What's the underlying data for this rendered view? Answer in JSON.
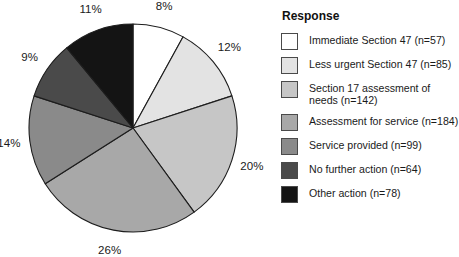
{
  "chart_data": {
    "type": "pie",
    "title": "",
    "legend_title": "Response",
    "legend_position": "right",
    "total_n": 709,
    "start_angle_deg": 0,
    "direction": "clockwise",
    "categories": [
      "Immediate Section 47 (n=57)",
      "Less urgent Section 47 (n=85)",
      "Section 17 assessment of needs (n=142)",
      "Assessment for service (n=184)",
      "Service provided (n=99)",
      "No further action (n=64)",
      "Other action (n=78)"
    ],
    "values": [
      8,
      12,
      20,
      26,
      14,
      9,
      11
    ],
    "counts": [
      57,
      85,
      142,
      184,
      99,
      64,
      78
    ],
    "value_labels": [
      "8%",
      "12%",
      "20%",
      "26%",
      "14%",
      "9%",
      "11%"
    ],
    "colors": [
      "#ffffff",
      "#e3e3e3",
      "#c6c6c6",
      "#a8a8a8",
      "#8a8a8a",
      "#4a4a4a",
      "#141414"
    ],
    "slices": [
      {
        "label": "Immediate Section 47 (n=57)",
        "pct_label": "8%",
        "value": 8,
        "count": 57,
        "color": "#ffffff"
      },
      {
        "label": "Less urgent Section 47 (n=85)",
        "pct_label": "12%",
        "value": 12,
        "count": 85,
        "color": "#e3e3e3"
      },
      {
        "label": "Section 17 assessment of needs (n=142)",
        "pct_label": "20%",
        "value": 20,
        "count": 142,
        "color": "#c6c6c6"
      },
      {
        "label": "Assessment for service (n=184)",
        "pct_label": "26%",
        "value": 26,
        "count": 184,
        "color": "#a8a8a8"
      },
      {
        "label": "Service provided (n=99)",
        "pct_label": "14%",
        "value": 14,
        "count": 99,
        "color": "#8a8a8a"
      },
      {
        "label": "No further action (n=64)",
        "pct_label": "9%",
        "value": 9,
        "count": 64,
        "color": "#4a4a4a"
      },
      {
        "label": "Other action (n=78)",
        "pct_label": "11%",
        "value": 11,
        "count": 78,
        "color": "#141414"
      }
    ]
  },
  "legend": {
    "title": "Response",
    "items": [
      {
        "label": "Immediate Section 47 (n=57)",
        "color": "#ffffff"
      },
      {
        "label": "Less urgent Section 47 (n=85)",
        "color": "#e3e3e3"
      },
      {
        "label": "Section 17 assessment of needs (n=142)",
        "color": "#c6c6c6"
      },
      {
        "label": "Assessment for service (n=184)",
        "color": "#a8a8a8"
      },
      {
        "label": "Service provided (n=99)",
        "color": "#8a8a8a"
      },
      {
        "label": "No further action (n=64)",
        "color": "#4a4a4a"
      },
      {
        "label": "Other action (n=78)",
        "color": "#141414"
      }
    ]
  }
}
